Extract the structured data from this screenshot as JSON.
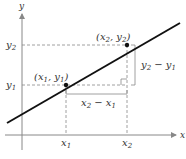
{
  "diagram": {
    "axes": {
      "x_label": "x",
      "y_label": "y"
    },
    "ticks": {
      "x1": "x",
      "x1_sub": "1",
      "x2": "x",
      "x2_sub": "2",
      "y1": "y",
      "y1_sub": "1",
      "y2": "y",
      "y2_sub": "2"
    },
    "points": [
      {
        "name": "P1",
        "label": "(x1, y1)",
        "text_open": "(x",
        "s1": "1",
        "mid": ", y",
        "s2": "1",
        "close": ")"
      },
      {
        "name": "P2",
        "label": "(x2, y2)",
        "text_open": "(x",
        "s1": "2",
        "mid": ", y",
        "s2": "2",
        "close": ")"
      }
    ],
    "run_label": {
      "a": "x",
      "a_sub": "2",
      "minus": " − x",
      "b_sub": "1",
      "full": "x2 − x1"
    },
    "rise_label": {
      "a": "y",
      "a_sub": "2",
      "minus": " − y",
      "b_sub": "1",
      "full": "y2 − y1"
    },
    "colors": {
      "line": "#111111",
      "axis": "#888888",
      "dashed": "#888888",
      "text": "#333333"
    }
  }
}
